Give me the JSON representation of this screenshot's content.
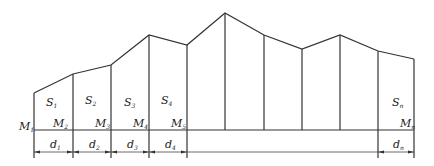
{
  "diagram": {
    "type": "cross-section area segments",
    "baseline_y": 130,
    "dim_line_y": 152,
    "profile_points": [
      [
        34,
        93
      ],
      [
        73,
        74
      ],
      [
        111,
        65
      ],
      [
        149,
        35
      ],
      [
        187,
        45
      ],
      [
        225,
        13
      ],
      [
        264,
        35
      ],
      [
        302,
        49
      ],
      [
        340,
        35
      ],
      [
        378,
        51
      ],
      [
        414,
        59
      ]
    ],
    "area_labels": [
      {
        "main": "S",
        "sub": "1",
        "x": 46,
        "y": 106
      },
      {
        "main": "S",
        "sub": "2",
        "x": 85,
        "y": 104
      },
      {
        "main": "S",
        "sub": "3",
        "x": 124,
        "y": 106
      },
      {
        "main": "S",
        "sub": "4",
        "x": 161,
        "y": 104
      },
      {
        "main": "S",
        "sub": "n",
        "x": 392,
        "y": 106
      }
    ],
    "point_labels": [
      {
        "main": "M",
        "sub": "1",
        "x": 19,
        "y": 130
      },
      {
        "main": "M",
        "sub": "2",
        "x": 53,
        "y": 127
      },
      {
        "main": "M",
        "sub": "3",
        "x": 95,
        "y": 127
      },
      {
        "main": "M",
        "sub": "4",
        "x": 133,
        "y": 127
      },
      {
        "main": "M",
        "sub": "5",
        "x": 171,
        "y": 127
      },
      {
        "main": "M",
        "sub": "n",
        "x": 400,
        "y": 127
      }
    ],
    "dimension_labels": [
      {
        "main": "d",
        "sub": "1",
        "x": 50,
        "y": 148
      },
      {
        "main": "d",
        "sub": "2",
        "x": 89,
        "y": 148
      },
      {
        "main": "d",
        "sub": "3",
        "x": 127,
        "y": 148
      },
      {
        "main": "d",
        "sub": "4",
        "x": 165,
        "y": 148
      },
      {
        "main": "d",
        "sub": "n",
        "x": 393,
        "y": 148
      }
    ]
  }
}
